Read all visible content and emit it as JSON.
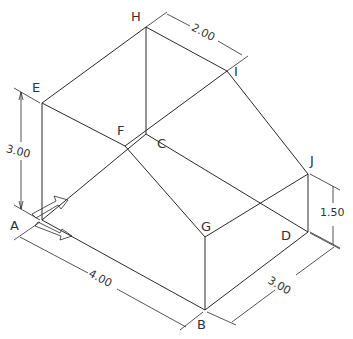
{
  "diagram": {
    "type": "isometric-drawing",
    "colors": {
      "line": "#2a2a2a",
      "background": "#ffffff",
      "text": "#333333"
    },
    "vertices": {
      "A": {
        "label": "A"
      },
      "B": {
        "label": "B"
      },
      "C": {
        "label": "C"
      },
      "D": {
        "label": "D"
      },
      "E": {
        "label": "E"
      },
      "F": {
        "label": "F"
      },
      "G": {
        "label": "G"
      },
      "H": {
        "label": "H"
      },
      "I": {
        "label": "I"
      },
      "J": {
        "label": "J"
      }
    },
    "dimensions": {
      "height_left": "3.00",
      "top_width": "2.00",
      "front_length": "4.00",
      "side_depth": "3.00",
      "right_height": "1.50"
    }
  }
}
